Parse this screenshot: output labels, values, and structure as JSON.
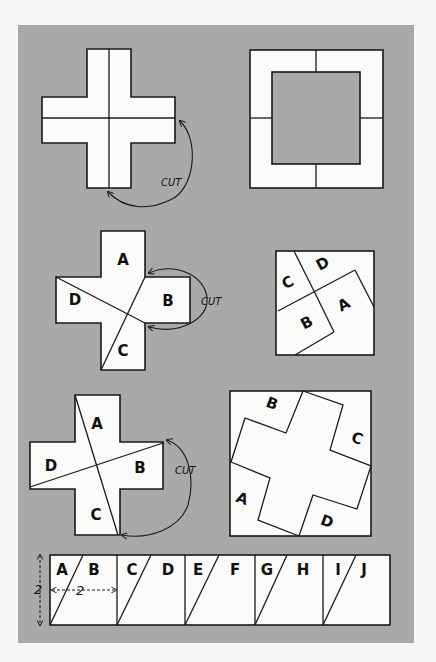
{
  "figure": {
    "panel_color": "#a9a9a7",
    "paper_color": "#fbfbf9",
    "ink_color": "#1a1a1a"
  },
  "row1": {
    "cut_label": "CUT"
  },
  "row2": {
    "cut_label": "CUT",
    "cross_labels": {
      "a": "A",
      "b": "B",
      "c": "C",
      "d": "D"
    },
    "square_labels": {
      "a": "A",
      "b": "B",
      "c": "C",
      "d": "D"
    }
  },
  "row3": {
    "cut_label": "CUT",
    "cross_labels": {
      "a": "A",
      "b": "B",
      "c": "C",
      "d": "D"
    },
    "square_labels": {
      "a": "A",
      "b": "B",
      "c": "C",
      "d": "D"
    }
  },
  "strip": {
    "labels": [
      "A",
      "B",
      "C",
      "D",
      "E",
      "F",
      "G",
      "H",
      "I",
      "J"
    ],
    "height_dim": "2",
    "width_dim": "2"
  }
}
